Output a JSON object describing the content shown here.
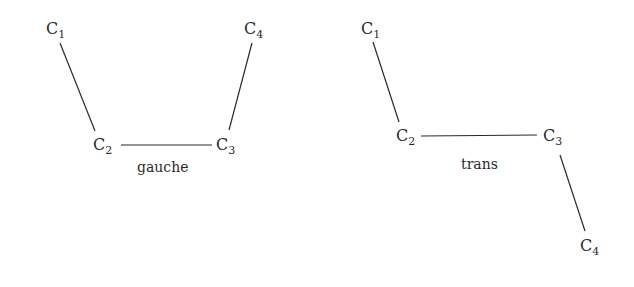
{
  "diagrams": [
    {
      "name": "gauche",
      "caption": "gauche",
      "atoms": [
        {
          "element": "C",
          "index": "1"
        },
        {
          "element": "C",
          "index": "2"
        },
        {
          "element": "C",
          "index": "3"
        },
        {
          "element": "C",
          "index": "4"
        }
      ],
      "bonds": [
        [
          "C1",
          "C2"
        ],
        [
          "C2",
          "C3"
        ],
        [
          "C3",
          "C4"
        ]
      ]
    },
    {
      "name": "trans",
      "caption": "trans",
      "atoms": [
        {
          "element": "C",
          "index": "1"
        },
        {
          "element": "C",
          "index": "2"
        },
        {
          "element": "C",
          "index": "3"
        },
        {
          "element": "C",
          "index": "4"
        }
      ],
      "bonds": [
        [
          "C1",
          "C2"
        ],
        [
          "C2",
          "C3"
        ],
        [
          "C3",
          "C4"
        ]
      ]
    }
  ],
  "colors": {
    "ink": "#2a2a2a",
    "background": "#ffffff"
  }
}
